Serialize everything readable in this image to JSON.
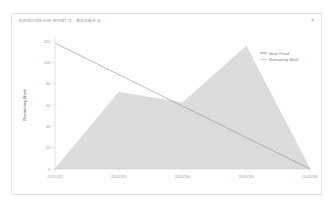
{
  "card": {
    "title": "BURNDOWN FOR SPRINT 11 - 通訊功能改善",
    "close_label": "×"
  },
  "colors": {
    "card_border": "#e2e2e2",
    "background": "#ffffff",
    "ideal_trend_line": "#9b9b9b",
    "remaining_work_fill": "#dcdcdc",
    "remaining_work_line": "#cfcfcf",
    "axis": "#c8c8c8",
    "tick_label": "#9b9b9b",
    "title_text": "#8e8e8e"
  },
  "chart_data": {
    "type": "area",
    "title": "BURNDOWN FOR SPRINT 11 - 通訊功能改善",
    "xlabel": "",
    "ylabel": "Remaining Work",
    "ylim": [
      0,
      120
    ],
    "yticks": [
      0,
      20,
      40,
      60,
      80,
      100,
      120
    ],
    "ytick_labels": [
      "0",
      "20",
      "40",
      "60",
      "80",
      "100",
      "120"
    ],
    "x": [
      "2015/3/2",
      "2015/3/3",
      "2015/3/4",
      "2015/3/5",
      "2015/3/6"
    ],
    "xtick_labels": [
      "2015/3/2",
      "2015/3/3",
      "2015/3/4",
      "2015/3/5",
      "2015/3/6"
    ],
    "grid": false,
    "legend_position": "top-right",
    "series": [
      {
        "name": "Ideal Trend",
        "type": "line",
        "color": "#9b9b9b",
        "values": [
          118,
          88.5,
          59,
          29.5,
          0
        ]
      },
      {
        "name": "Remaining Work",
        "type": "area",
        "color": "#dcdcdc",
        "values": [
          0,
          72,
          62,
          115,
          0
        ]
      }
    ]
  },
  "legend": {
    "items": [
      {
        "label": "Ideal Trend",
        "color": "#9b9b9b"
      },
      {
        "label": "Remaining Work",
        "color": "#cfcfcf"
      }
    ]
  }
}
